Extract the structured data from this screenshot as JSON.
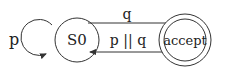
{
  "diagram": {
    "type": "state-machine",
    "states": [
      {
        "id": "S0",
        "label": "S0",
        "accepting": false
      },
      {
        "id": "accept",
        "label": "accept",
        "accepting": true
      }
    ],
    "transitions": [
      {
        "from": "S0",
        "to": "S0",
        "label": "p"
      },
      {
        "from": "S0",
        "to": "accept",
        "label": "q"
      },
      {
        "from": "accept",
        "to": "S0",
        "label": "p || q"
      }
    ],
    "colors": {
      "stroke": "#333333",
      "text": "#222222",
      "background": "#ffffff"
    }
  }
}
